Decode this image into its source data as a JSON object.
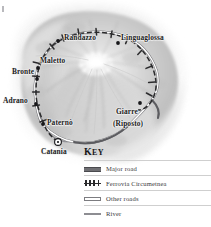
{
  "map": {
    "title": "Mount Etna and the Ferrovia Circumetnea railway",
    "region": "Sicily, Italy",
    "places": [
      {
        "name": "Randazzo",
        "type": "town",
        "x": 64,
        "y": 38,
        "dot_x": 58,
        "dot_y": 41
      },
      {
        "name": "Linguaglossa",
        "type": "town",
        "x": 121,
        "y": 38,
        "dot_x": 118,
        "dot_y": 43
      },
      {
        "name": "Maletto",
        "type": "town",
        "x": 40,
        "y": 61,
        "dot_x": 38,
        "dot_y": 68
      },
      {
        "name": "Bronte",
        "type": "town",
        "x": 13,
        "y": 72,
        "dot_x": 37,
        "dot_y": 79
      },
      {
        "name": "Adrano",
        "type": "town",
        "x": 4,
        "y": 101,
        "dot_x": 36,
        "dot_y": 104
      },
      {
        "name": "Paternò",
        "type": "town",
        "x": 47,
        "y": 123,
        "dot_x": 43,
        "dot_y": 124
      },
      {
        "name": "Catania",
        "type": "city",
        "x": 42,
        "y": 152,
        "dot_x": 58,
        "dot_y": 142
      },
      {
        "name": "Giarre",
        "type": "town",
        "x": 116,
        "y": 112,
        "dot_x": 140,
        "dot_y": 103
      },
      {
        "name": "(Riposto)",
        "type": "town",
        "x": 113,
        "y": 124,
        "dot_x": 0,
        "dot_y": 0
      }
    ],
    "colors": {
      "terrain_light": "#ededed",
      "terrain_mid": "#d8d8d8",
      "terrain_dark": "#b0b0b0",
      "railway": "#2a2a2c",
      "major_road": "#6f6f73",
      "river": "#8d8d92",
      "label_text": "#1d1d1d",
      "background": "#ffffff"
    }
  },
  "key": {
    "title_cap": "K",
    "title_rest": "EY",
    "items": [
      {
        "label": "Major road",
        "symbol": "major-road-symbol"
      },
      {
        "label": "Ferrovia Circumetnea",
        "symbol": "railway-symbol"
      },
      {
        "label": "Other roads",
        "symbol": "other-roads-symbol"
      },
      {
        "label": "River",
        "symbol": "river-symbol"
      }
    ]
  }
}
